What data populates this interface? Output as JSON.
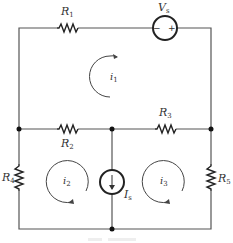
{
  "diagram": {
    "type": "circuit",
    "components": {
      "R1": {
        "label": "R",
        "sub": "1",
        "kind": "resistor"
      },
      "R2": {
        "label": "R",
        "sub": "2",
        "kind": "resistor"
      },
      "R3": {
        "label": "R",
        "sub": "3",
        "kind": "resistor"
      },
      "R4": {
        "label": "R",
        "sub": "4",
        "kind": "resistor"
      },
      "R5": {
        "label": "R",
        "sub": "5",
        "kind": "resistor"
      },
      "Vs": {
        "label": "V",
        "sub": "s",
        "kind": "voltage-source",
        "minus": "−",
        "plus": "+"
      },
      "Is": {
        "label": "I",
        "sub": "s",
        "kind": "current-source",
        "direction": "down"
      }
    },
    "mesh_currents": {
      "i1": {
        "label": "i",
        "sub": "1",
        "direction": "clockwise"
      },
      "i2": {
        "label": "i",
        "sub": "2",
        "direction": "clockwise"
      },
      "i3": {
        "label": "i",
        "sub": "3",
        "direction": "clockwise"
      }
    },
    "colors": {
      "wire": "#555555",
      "component": "#222222",
      "label": "#333333"
    }
  }
}
